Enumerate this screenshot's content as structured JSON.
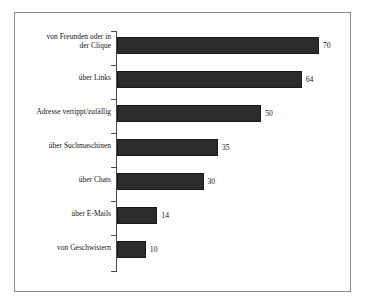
{
  "chart_data": {
    "type": "bar",
    "orientation": "horizontal",
    "title": "",
    "subtitle": "",
    "xlabel": "",
    "ylabel": "",
    "xlim": [
      0,
      70
    ],
    "grid": false,
    "legend": null,
    "categories": [
      "von Freunden oder in der Clique",
      "über Links",
      "Adresse vertippt/zufällig",
      "über Suchmaschinen",
      "über Chats",
      "über E-Mails",
      "von Geschwistern"
    ],
    "values": [
      70,
      64,
      50,
      35,
      30,
      14,
      10
    ],
    "value_labels": [
      "70",
      "64",
      "50",
      "35",
      "30",
      "14",
      "10"
    ],
    "bars": [
      {
        "label_line1": "von Freunden oder in",
        "label_line2": "der Clique",
        "value": 70,
        "value_label": "70"
      },
      {
        "label_line1": "über Links",
        "label_line2": "",
        "value": 64,
        "value_label": "64"
      },
      {
        "label_line1": "Adresse vertippt/zufällig",
        "label_line2": "",
        "value": 50,
        "value_label": "50"
      },
      {
        "label_line1": "über Suchmaschinen",
        "label_line2": "",
        "value": 35,
        "value_label": "35"
      },
      {
        "label_line1": "über Chats",
        "label_line2": "",
        "value": 30,
        "value_label": "30"
      },
      {
        "label_line1": "über E-Mails",
        "label_line2": "",
        "value": 14,
        "value_label": "14"
      },
      {
        "label_line1": "von Geschwistern",
        "label_line2": "",
        "value": 10,
        "value_label": "10"
      }
    ],
    "colors": {
      "bar_fill": "#2c2c2c",
      "bar_stroke": "#1a1a1a",
      "axis": "#4a4a4a",
      "frame": "#8a8a8a",
      "text": "#141414",
      "background": "#ffffff"
    }
  }
}
